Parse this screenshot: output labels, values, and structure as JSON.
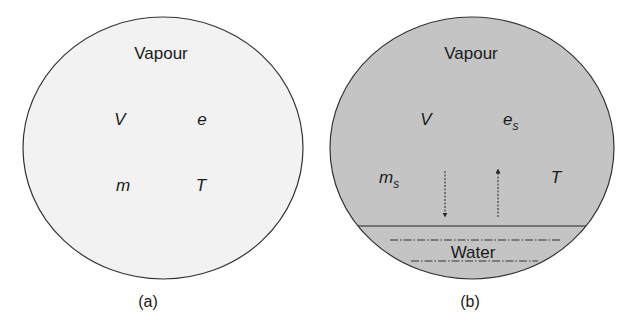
{
  "figure": {
    "panel_a": {
      "title": "Vapour",
      "var_v": "V",
      "var_e": "e",
      "var_m": "m",
      "var_t": "T",
      "caption": "(a)",
      "fill": "#f2f2f2"
    },
    "panel_b": {
      "title": "Vapour",
      "var_v": "V",
      "var_e": "e",
      "var_e_sub": "s",
      "var_m": "m",
      "var_m_sub": "s",
      "var_t": "T",
      "water_label": "Water",
      "caption": "(b)",
      "fill": "#c4c4c4"
    }
  }
}
